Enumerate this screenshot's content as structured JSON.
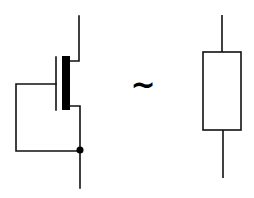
{
  "diagram": {
    "left_symbol": {
      "type": "depletion-mode MOSFET (gate connected to source)",
      "terminals": [
        "drain",
        "gate",
        "source"
      ],
      "junction_dot": true
    },
    "operator": {
      "symbol": "~",
      "meaning": "approximately equivalent"
    },
    "right_symbol": {
      "type": "resistor"
    },
    "colors": {
      "stroke": "#000000",
      "background": "#ffffff"
    }
  }
}
